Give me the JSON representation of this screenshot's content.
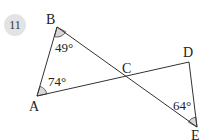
{
  "problem": {
    "number": "11"
  },
  "diagram": {
    "vertices": {
      "A": {
        "label": "A"
      },
      "B": {
        "label": "B"
      },
      "C": {
        "label": "C"
      },
      "D": {
        "label": "D"
      },
      "E": {
        "label": "E"
      }
    },
    "angles": {
      "B": "49°",
      "A": "74°",
      "E": "64°"
    },
    "segments": [
      "AB",
      "BE",
      "AD",
      "DE"
    ],
    "colors": {
      "line": "#333333",
      "angle_fill": "#d8d8d8",
      "badge": "#e3e3e3"
    }
  }
}
